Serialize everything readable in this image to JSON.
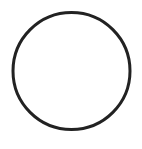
{
  "shape": {
    "type": "circle",
    "cx": 71.5,
    "cy": 71,
    "r": 58.5,
    "stroke_color": "#222222",
    "stroke_width": 3,
    "fill": "none"
  },
  "background_color": "#ffffff"
}
